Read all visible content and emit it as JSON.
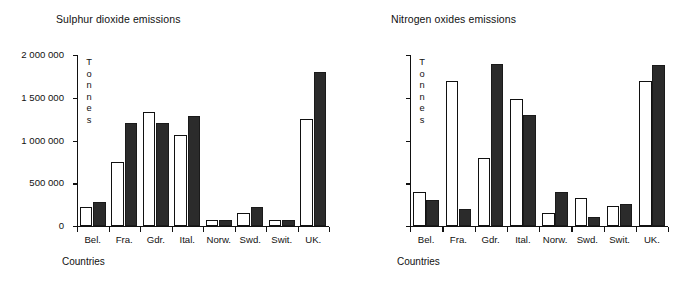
{
  "chart_data": [
    {
      "type": "bar",
      "title": "Sulphur dioxide emissions",
      "xlabel": "Countries",
      "ylabel": "Tonnes",
      "ylim": [
        0,
        6000000
      ],
      "ytick_values": [
        0,
        1500000,
        3000000,
        4500000,
        6000000
      ],
      "ytick_labels": [
        "0",
        "1 500 000",
        "3 000 000",
        "4 500 000",
        "6 000 000"
      ],
      "grid": false,
      "legend": "none",
      "categories": [
        "Bel.",
        "Fra.",
        "Gdr.",
        "Ital.",
        "Norw.",
        "Swd.",
        "Swit.",
        "UK."
      ],
      "series": [
        {
          "name": "open",
          "style": "white-bar",
          "values": [
            650000,
            2250000,
            4000000,
            3200000,
            200000,
            450000,
            200000,
            3750000
          ]
        },
        {
          "name": "solid",
          "style": "black-bar",
          "values": [
            850000,
            3600000,
            3600000,
            3850000,
            200000,
            650000,
            200000,
            5400000
          ]
        }
      ]
    },
    {
      "type": "bar",
      "title": "Nitrogen oxides emissions",
      "xlabel": "Countries",
      "ylabel": "Tonnes",
      "ylim": [
        0,
        2000000
      ],
      "ytick_values": [
        0,
        500000,
        1000000,
        1500000,
        2000000
      ],
      "ytick_labels": [
        "0",
        "500 000",
        "1 000 000",
        "1 500 000",
        "2 000 000"
      ],
      "grid": false,
      "legend": "none",
      "categories": [
        "Bel.",
        "Fra.",
        "Gdr.",
        "Ital.",
        "Norw.",
        "Swd.",
        "Swit.",
        "UK."
      ],
      "series": [
        {
          "name": "open",
          "style": "white-bar",
          "values": [
            400000,
            1700000,
            800000,
            1480000,
            150000,
            330000,
            230000,
            1700000
          ]
        },
        {
          "name": "solid",
          "style": "black-bar",
          "values": [
            300000,
            200000,
            1900000,
            1300000,
            400000,
            110000,
            260000,
            1880000
          ]
        }
      ]
    }
  ],
  "colors": {
    "ink": "#111111",
    "open_bar_fill": "#ffffff",
    "solid_bar_fill": "#2b2b2b",
    "background": "#ffffff"
  }
}
